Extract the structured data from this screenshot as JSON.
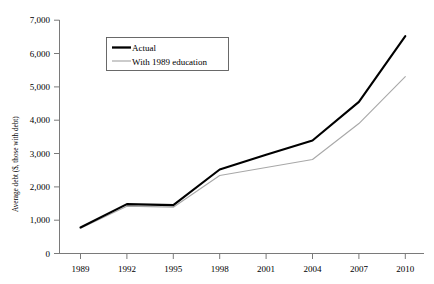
{
  "chart_data": {
    "type": "line",
    "title": "",
    "xlabel": "",
    "ylabel": "Average debt ($, those with debt)",
    "categories": [
      "1989",
      "1992",
      "1995",
      "1998",
      "2001",
      "2004",
      "2007",
      "2010"
    ],
    "x_tick_labels": [
      "1989",
      "1992",
      "1995",
      "1998",
      "2001",
      "2004",
      "2007",
      "2010"
    ],
    "y_tick_labels": [
      "0",
      "1,000",
      "2,000",
      "3,000",
      "4,000",
      "5,000",
      "6,000",
      "7,000"
    ],
    "y_tick_values": [
      0,
      1000,
      2000,
      3000,
      4000,
      5000,
      6000,
      7000
    ],
    "ylim": [
      0,
      7000
    ],
    "grid": false,
    "legend_position": "top-left-inside",
    "series": [
      {
        "name": "Actual",
        "color": "#000000",
        "line_width": 2.1,
        "values": [
          780,
          1480,
          1450,
          2520,
          2960,
          3390,
          4550,
          6520
        ]
      },
      {
        "name": "With 1989 education",
        "color": "#a8a8a8",
        "line_width": 1.1,
        "values": [
          760,
          1420,
          1390,
          2340,
          2580,
          2820,
          3900,
          5310
        ]
      }
    ],
    "legend": [
      {
        "label": "Actual",
        "color": "#000000",
        "line_width": 2.1
      },
      {
        "label": "With 1989 education",
        "color": "#a8a8a8",
        "line_width": 1.1
      }
    ]
  }
}
